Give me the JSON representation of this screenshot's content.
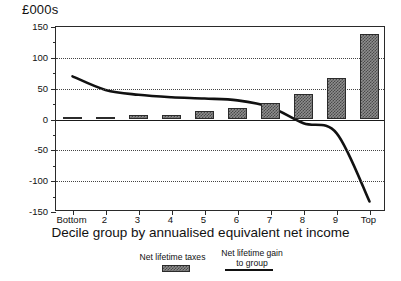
{
  "chart_data": {
    "type": "bar",
    "title": "",
    "unit_label": "£000s",
    "xlabel": "Decile group by annualised equivalent net income",
    "ylabel": "£000s",
    "categories": [
      "Bottom",
      "2",
      "3",
      "4",
      "5",
      "6",
      "7",
      "8",
      "9",
      "Top"
    ],
    "ylim": [
      -150,
      150
    ],
    "yticks": [
      150,
      100,
      50,
      0,
      -50,
      -100,
      -150
    ],
    "ytick_labels": [
      "150",
      "100",
      "50",
      "0",
      "-50",
      "-100",
      "-150"
    ],
    "minor_tick_step": 25,
    "grid": "horizontal dotted at 100, 50, -50, -100; solid zero line",
    "legend_position": "below-axis",
    "series": [
      {
        "name": "Net lifetime taxes",
        "type": "bar",
        "values": [
          1,
          3,
          7,
          8,
          14,
          18,
          26,
          41,
          67,
          138
        ]
      },
      {
        "name": "Net lifetime gain to group",
        "type": "line",
        "values": [
          70,
          48,
          40,
          36,
          34,
          31,
          20,
          -6,
          -22,
          -133
        ]
      }
    ]
  },
  "legend": {
    "bars_label": "Net lifetime taxes",
    "line_label_line1": "Net lifetime gain",
    "line_label_line2": "to group"
  },
  "axis": {
    "unit": "£000s",
    "x_title": "Decile group by annualised equivalent net income"
  }
}
